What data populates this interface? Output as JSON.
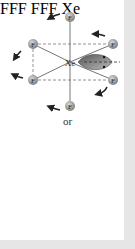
{
  "figure": {
    "top_diagram": {
      "center_label": "Xe",
      "ligand_label": "F",
      "ligand_count": 6,
      "lone_pair": "equatorial-right"
    },
    "separator": "or",
    "bottom_diagram": {
      "center_label": "Xe",
      "ligand_label": "F",
      "ligand_count": 6,
      "lone_pair": "upper-right-capped"
    },
    "colors": {
      "atom": "#9a9a9a",
      "bond": "#666666",
      "dashed": "#777777",
      "arrow": "#222222",
      "lone_pair": "#7a7a7a",
      "frame": "#e6e6e6"
    }
  }
}
